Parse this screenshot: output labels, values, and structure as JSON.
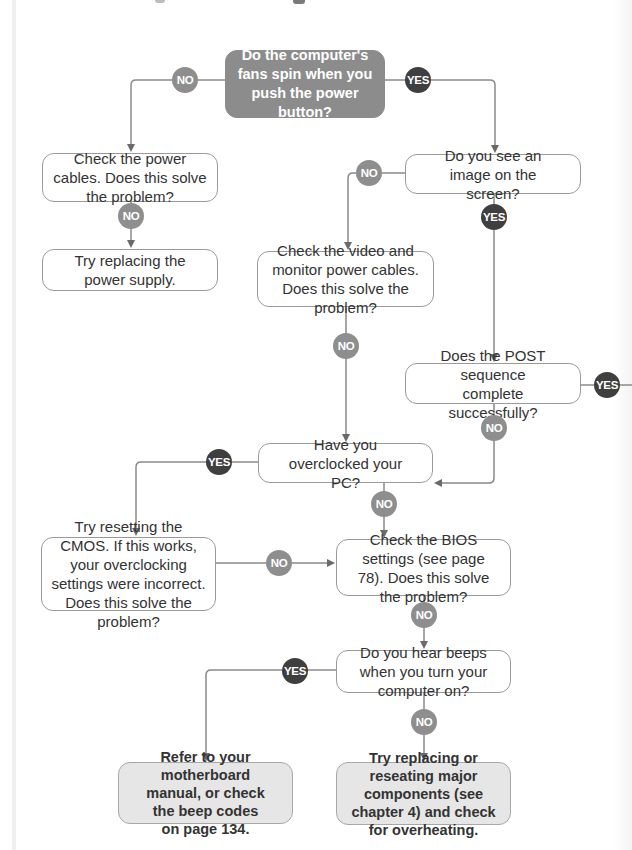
{
  "colors": {
    "start_fill": "#8c8c8c",
    "final_fill": "#e6e6e6",
    "no_badge": "#8e8e8e",
    "yes_badge": "#3f3f3f",
    "connector": "#8a8a8a"
  },
  "labels": {
    "no": "NO",
    "yes": "YES"
  },
  "nodes": {
    "start": "Do the computer's fans spin when you push the power button?",
    "power_cables": "Check the power cables. Does this solve the problem?",
    "power_supply": "Try replacing the power supply.",
    "image_on_screen": "Do you see an image on the screen?",
    "video_cables": "Check the video and monitor power cables. Does this solve the problem?",
    "post_sequence": "Does the POST sequence complete successfully?",
    "overclocked": "Have you overclocked your PC?",
    "reset_cmos": "Try resetting the CMOS. If this works, your overclocking settings were incorrect. Does this solve the problem?",
    "bios_settings": "Check the BIOS settings (see page 78). Does this solve the problem?",
    "hear_beeps": "Do you hear beeps when you turn your computer on?",
    "motherboard_manual": "Refer to your motherboard manual, or check the beep codes on page 134.",
    "replace_components": "Try replacing or reseating major components (see chapter 4) and check for overheating."
  }
}
